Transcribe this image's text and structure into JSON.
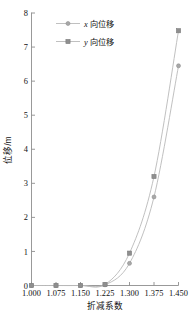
{
  "chart_data": {
    "type": "line",
    "title": "",
    "xlabel": "折减系数",
    "ylabel": "位移/m",
    "xlim": [
      1.0,
      1.45
    ],
    "ylim": [
      0,
      8
    ],
    "grid": false,
    "legend_position": "top-left-inside",
    "x": [
      1.0,
      1.075,
      1.15,
      1.225,
      1.3,
      1.375,
      1.45
    ],
    "xticklabels": [
      "1.000",
      "1.075",
      "1.150",
      "1.225",
      "1.300",
      "1.375",
      "1.450"
    ],
    "yticklabels": [
      "0",
      "1",
      "2",
      "3",
      "4",
      "5",
      "6",
      "7",
      "8"
    ],
    "yticks": [
      0,
      1,
      2,
      3,
      4,
      5,
      6,
      7,
      8
    ],
    "series": [
      {
        "name": "x向位移",
        "name_italic_prefix": "x",
        "name_rest": "向位移",
        "marker": "circle",
        "color": "#a8a8a8",
        "values": [
          0.0,
          0.0,
          0.0,
          0.02,
          0.65,
          2.6,
          6.45
        ]
      },
      {
        "name": "y向位移",
        "name_italic_prefix": "y",
        "name_rest": "向位移",
        "marker": "square",
        "color": "#8f8f8f",
        "values": [
          0.0,
          0.0,
          0.0,
          0.03,
          0.95,
          3.2,
          7.48
        ]
      }
    ]
  },
  "colors": {
    "axis": "#8d8d8d",
    "line": "#b9b9b9",
    "marker_x": "#a8a8a8",
    "marker_y": "#8f8f8f",
    "text": "#111111",
    "background": "#ffffff"
  }
}
